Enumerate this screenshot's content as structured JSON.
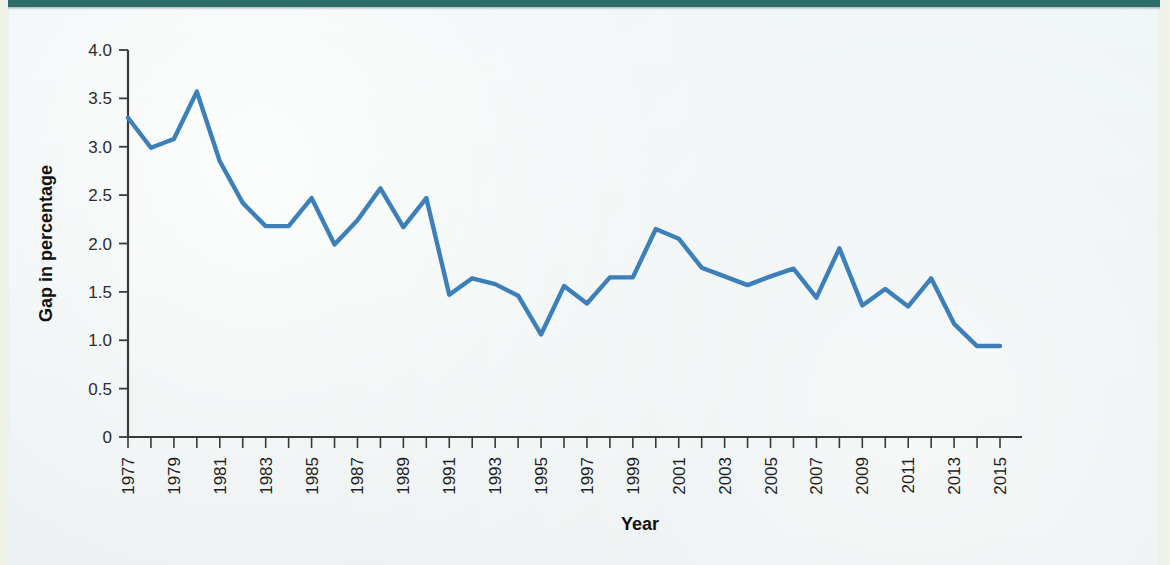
{
  "figure": {
    "background_color": "#eef3f3",
    "header_band_color": "#2f6b66",
    "line_color": "#3d7fb8",
    "axis_color": "#3a3a3a"
  },
  "chart_data": {
    "type": "line",
    "title": "",
    "subtitle": "",
    "xlabel": "Year",
    "ylabel": "Gap in percentage",
    "xlim": [
      1977,
      2015
    ],
    "ylim": [
      0,
      4.0
    ],
    "ytick_labels": [
      "0",
      "0.5",
      "1.0",
      "1.5",
      "2.0",
      "2.5",
      "3.0",
      "3.5",
      "4.0"
    ],
    "ytick_values": [
      0,
      0.5,
      1.0,
      1.5,
      2.0,
      2.5,
      3.0,
      3.5,
      4.0
    ],
    "xtick_labels": [
      "1977",
      "1979",
      "1981",
      "1983",
      "1985",
      "1987",
      "1989",
      "1991",
      "1993",
      "1995",
      "1997",
      "1999",
      "2001",
      "2003",
      "2005",
      "2007",
      "2009",
      "2011",
      "2013",
      "2015"
    ],
    "xtick_values": [
      1977,
      1979,
      1981,
      1983,
      1985,
      1987,
      1989,
      1991,
      1993,
      1995,
      1997,
      1999,
      2001,
      2003,
      2005,
      2007,
      2009,
      2011,
      2013,
      2015
    ],
    "xtick_minor_every": 1,
    "grid": false,
    "legend": false,
    "legend_position": "none",
    "x": [
      1977,
      1978,
      1979,
      1980,
      1981,
      1982,
      1983,
      1984,
      1985,
      1986,
      1987,
      1988,
      1989,
      1990,
      1991,
      1992,
      1993,
      1994,
      1995,
      1996,
      1997,
      1998,
      1999,
      2000,
      2001,
      2002,
      2003,
      2004,
      2005,
      2006,
      2007,
      2008,
      2009,
      2010,
      2011,
      2012,
      2013,
      2014,
      2015
    ],
    "values": [
      3.3,
      2.99,
      3.08,
      3.57,
      2.85,
      2.42,
      2.18,
      2.18,
      2.47,
      1.99,
      2.24,
      2.57,
      2.17,
      2.47,
      1.47,
      1.64,
      1.58,
      1.46,
      1.06,
      1.56,
      1.38,
      1.65,
      1.65,
      2.15,
      2.05,
      1.75,
      1.66,
      1.57,
      1.66,
      1.74,
      1.44,
      1.95,
      1.36,
      1.53,
      1.35,
      1.64,
      1.17,
      0.94,
      0.94
    ],
    "series": [
      {
        "name": "Gap in percentage",
        "color": "#3d7fb8",
        "values": [
          3.3,
          2.99,
          3.08,
          3.57,
          2.85,
          2.42,
          2.18,
          2.18,
          2.47,
          1.99,
          2.24,
          2.57,
          2.17,
          2.47,
          1.47,
          1.64,
          1.58,
          1.46,
          1.06,
          1.56,
          1.38,
          1.65,
          1.65,
          2.15,
          2.05,
          1.75,
          1.66,
          1.57,
          1.66,
          1.74,
          1.44,
          1.95,
          1.36,
          1.53,
          1.35,
          1.64,
          1.17,
          0.94,
          0.94
        ]
      }
    ]
  }
}
